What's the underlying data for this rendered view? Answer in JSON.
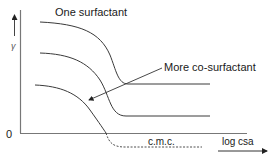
{
  "diagram": {
    "y_axis_label": "γ",
    "x_axis_label": "log csa",
    "origin_label": "0",
    "annotations": {
      "top_curve": "One surfactant",
      "arrow": "More co-surfactant",
      "cmc": "c.m.c."
    },
    "curves": [
      {
        "name": "one-surfactant",
        "plateau_start_y": "high",
        "style": "solid"
      },
      {
        "name": "intermediate-co-surfactant",
        "plateau_start_y": "mid",
        "style": "solid"
      },
      {
        "name": "more-co-surfactant",
        "plateau_start_y": "low",
        "style": "solid-then-dashed"
      }
    ],
    "colors": {
      "line": "#3a3a3a",
      "axis": "#555555",
      "text": "#1a1a1a"
    }
  }
}
